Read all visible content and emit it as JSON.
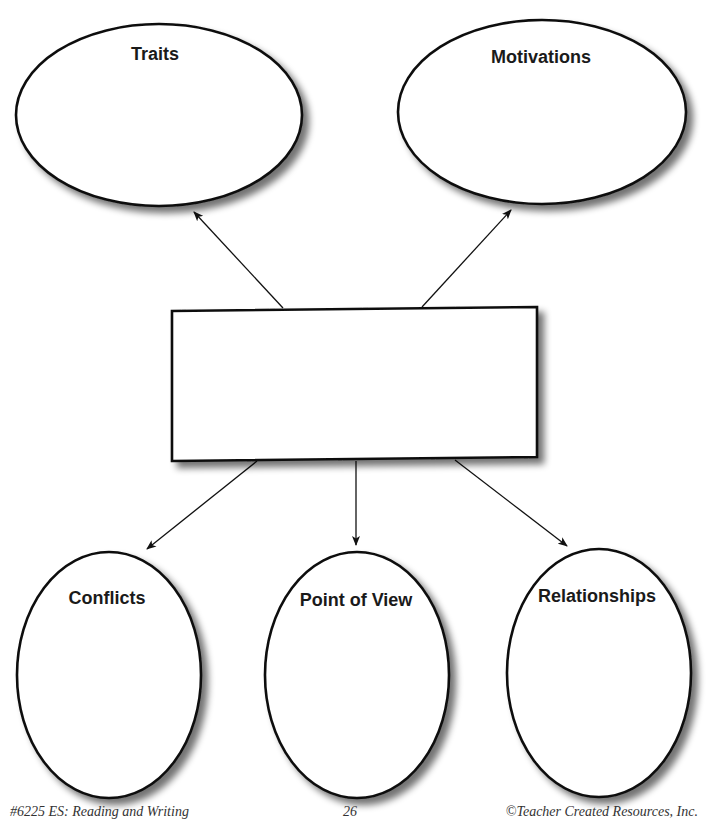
{
  "diagram": {
    "type": "character-web graphic organizer",
    "center": {
      "label": "",
      "shape": "rectangle"
    },
    "nodes": [
      {
        "id": "traits",
        "label": "Traits",
        "shape": "ellipse",
        "position": "top-left"
      },
      {
        "id": "motivations",
        "label": "Motivations",
        "shape": "ellipse",
        "position": "top-right"
      },
      {
        "id": "conflicts",
        "label": "Conflicts",
        "shape": "ellipse",
        "position": "bottom-left"
      },
      {
        "id": "point_of_view",
        "label": "Point of View",
        "shape": "ellipse",
        "position": "bottom-center"
      },
      {
        "id": "relationships",
        "label": "Relationships",
        "shape": "ellipse",
        "position": "bottom-right"
      }
    ],
    "edges": [
      {
        "from": "center",
        "to": "traits"
      },
      {
        "from": "center",
        "to": "motivations"
      },
      {
        "from": "center",
        "to": "conflicts"
      },
      {
        "from": "center",
        "to": "point_of_view"
      },
      {
        "from": "center",
        "to": "relationships"
      }
    ]
  },
  "footer": {
    "left": "#6225 ES:  Reading and Writing",
    "page_number": "26",
    "right": "©Teacher Created Resources, Inc."
  },
  "colors": {
    "stroke": "#111111",
    "shadow": "#9a9a9a",
    "fill": "#ffffff",
    "text": "#1a1a1a"
  }
}
